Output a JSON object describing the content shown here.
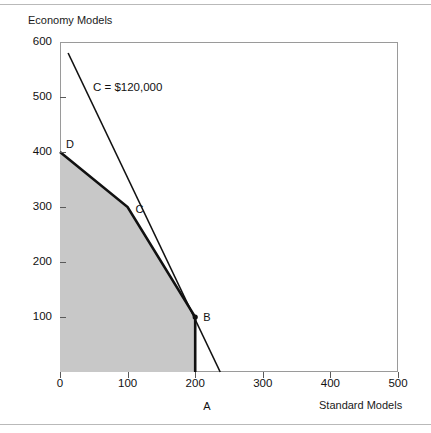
{
  "figure": {
    "y_axis_title": "Economy Models",
    "x_axis_title": "Standard Models"
  },
  "annotations": {
    "cost_line_label": "C = $120,000",
    "point_a": "A",
    "point_b": "B",
    "point_c": "C",
    "point_d": "D"
  },
  "chart_data": {
    "type": "line",
    "title": "",
    "subtitle": "",
    "xlabel": "Standard Models",
    "ylabel": "Economy Models",
    "xlim": [
      0,
      500
    ],
    "ylim": [
      0,
      600
    ],
    "xticks": [
      0,
      100,
      200,
      300,
      400,
      500
    ],
    "yticks": [
      0,
      100,
      200,
      300,
      400,
      500,
      600
    ],
    "xticklabels": [
      "0",
      "100",
      "200",
      "300",
      "400",
      "500"
    ],
    "yticklabels": [
      "0",
      "100",
      "200",
      "300",
      "400",
      "500",
      "600"
    ],
    "grid": false,
    "legend": null,
    "series": [
      {
        "name": "Feasible region boundary",
        "kind": "polyline",
        "style": "thick-black",
        "points": [
          [
            0,
            400
          ],
          [
            100,
            300
          ],
          [
            200,
            100
          ],
          [
            200,
            0
          ]
        ]
      },
      {
        "name": "Iso-cost line C = $120,000",
        "kind": "line",
        "style": "thin-black",
        "points": [
          [
            12,
            580
          ],
          [
            237,
            0
          ]
        ],
        "label": "C = $120,000"
      }
    ],
    "shaded_region": {
      "name": "Feasible region",
      "fill": "#c8c8c8",
      "vertices": [
        [
          0,
          0
        ],
        [
          0,
          400
        ],
        [
          100,
          300
        ],
        [
          200,
          100
        ],
        [
          200,
          0
        ]
      ]
    },
    "annotated_points": [
      {
        "label": "A",
        "x": 200,
        "y": 0,
        "label_offset": [
          8,
          28
        ],
        "marker": false
      },
      {
        "label": "B",
        "x": 200,
        "y": 100,
        "label_offset": [
          8,
          -6
        ],
        "marker": true
      },
      {
        "label": "C",
        "x": 100,
        "y": 300,
        "label_offset": [
          8,
          -4
        ],
        "marker": false
      },
      {
        "label": "D",
        "x": 0,
        "y": 400,
        "label_offset": [
          6,
          -14
        ],
        "marker": false
      }
    ]
  },
  "colors": {
    "frame_rule": "#b9b9b9",
    "axis": "#9a9a9a",
    "tick": "#5a5a5a",
    "region_fill": "#c8c8c8",
    "line": "#111111",
    "text": "#111111"
  }
}
